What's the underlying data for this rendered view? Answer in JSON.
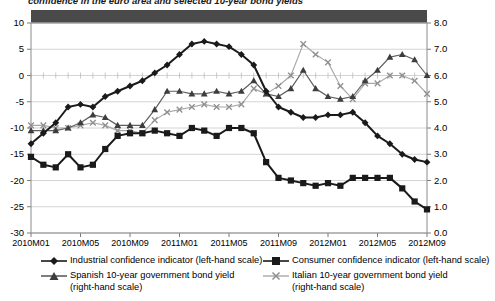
{
  "title": "confidence in the euro area and selected 10-year bond yields",
  "colors": {
    "industrial": "#1a1a1a",
    "consumer": "#1a1a1a",
    "spanish": "#5e5e5e",
    "italian": "#a8a8a8",
    "band": "#4a4a4a",
    "grid": "#c9c9c9",
    "axis": "#8c8c8c"
  },
  "axes": {
    "left_ticks": [
      "10",
      "5",
      "0",
      "-5",
      "-10",
      "-15",
      "-20",
      "-25",
      "-30"
    ],
    "right_ticks": [
      "8.0",
      "7.0",
      "6.0",
      "5.0",
      "4.0",
      "3.0",
      "2.0",
      "1.0",
      "0.0"
    ],
    "x_ticks": [
      "2010M01",
      "2010M05",
      "2010M09",
      "2011M01",
      "2011M05",
      "2011M09",
      "2012M01",
      "2012M05",
      "2012M09"
    ]
  },
  "legend": {
    "items": [
      {
        "label": "Industrial confidence indicator (left-hand scale)",
        "marker": "diamond-line-marker",
        "name": "legend-industrial"
      },
      {
        "label": "Consumer confidence indicator (left-hand scale)",
        "marker": "square-line-marker",
        "name": "legend-consumer"
      },
      {
        "label": "Spanish 10-year government bond yield",
        "label2": "(right-hand scale)",
        "marker": "triangle-line-marker",
        "name": "legend-spanish"
      },
      {
        "label": "Italian 10-year government bond yield",
        "label2": "(right-hand scale)",
        "marker": "cross-line-marker",
        "name": "legend-italian"
      }
    ]
  },
  "chart_data": {
    "type": "line",
    "title": "confidence in the euro area and selected 10-year bond yields",
    "xlabel": "",
    "ylabel": "",
    "ylim": [
      -30,
      10
    ],
    "y2lim": [
      0.0,
      8.0
    ],
    "grid": true,
    "legend_position": "bottom",
    "x": [
      "2010M01",
      "2010M02",
      "2010M03",
      "2010M04",
      "2010M05",
      "2010M06",
      "2010M07",
      "2010M08",
      "2010M09",
      "2010M10",
      "2010M11",
      "2010M12",
      "2011M01",
      "2011M02",
      "2011M03",
      "2011M04",
      "2011M05",
      "2011M06",
      "2011M07",
      "2011M08",
      "2011M09",
      "2011M10",
      "2011M11",
      "2011M12",
      "2012M01",
      "2012M02",
      "2012M03",
      "2012M04",
      "2012M05",
      "2012M06",
      "2012M07",
      "2012M08",
      "2012M09"
    ],
    "series": [
      {
        "name": "Industrial confidence indicator (left-hand scale)",
        "axis": "left",
        "values": [
          -13.0,
          -11.0,
          -9.0,
          -6.0,
          -5.5,
          -6.0,
          -4.0,
          -3.0,
          -2.0,
          -1.0,
          0.5,
          2.0,
          4.0,
          6.0,
          6.5,
          6.0,
          5.5,
          4.0,
          2.0,
          -3.0,
          -6.0,
          -7.0,
          -8.0,
          -8.0,
          -7.5,
          -7.5,
          -7.0,
          -9.0,
          -11.5,
          -13.0,
          -15.0,
          -16.0,
          -16.5
        ]
      },
      {
        "name": "Consumer confidence indicator (left-hand scale)",
        "axis": "left",
        "values": [
          -15.5,
          -17.0,
          -17.5,
          -15.0,
          -17.5,
          -17.0,
          -14.0,
          -11.5,
          -11.0,
          -11.0,
          -10.5,
          -11.0,
          -11.5,
          -10.0,
          -10.5,
          -11.5,
          -10.0,
          -10.0,
          -11.0,
          -16.5,
          -19.5,
          -20.0,
          -20.5,
          -21.0,
          -20.5,
          -21.0,
          -19.5,
          -19.5,
          -19.5,
          -19.5,
          -21.5,
          -24.0,
          -25.5
        ]
      },
      {
        "name": "Spanish 10-year government bond yield",
        "axis": "right",
        "values": [
          3.9,
          3.9,
          3.9,
          4.0,
          4.2,
          4.5,
          4.4,
          4.1,
          4.1,
          4.1,
          4.7,
          5.4,
          5.4,
          5.3,
          5.3,
          5.4,
          5.3,
          5.4,
          5.8,
          5.3,
          5.2,
          5.5,
          6.2,
          5.5,
          5.2,
          5.1,
          5.2,
          5.8,
          6.2,
          6.7,
          6.8,
          6.6,
          6.0
        ]
      },
      {
        "name": "Italian 10-year government bond yield",
        "axis": "right",
        "values": [
          4.1,
          4.1,
          4.0,
          4.0,
          4.1,
          4.2,
          4.1,
          3.9,
          3.9,
          3.8,
          4.3,
          4.6,
          4.7,
          4.8,
          4.9,
          4.8,
          4.8,
          4.9,
          5.5,
          5.3,
          5.6,
          6.0,
          7.2,
          6.8,
          6.5,
          5.6,
          5.1,
          5.7,
          5.7,
          6.0,
          6.0,
          5.8,
          5.3
        ]
      }
    ]
  }
}
